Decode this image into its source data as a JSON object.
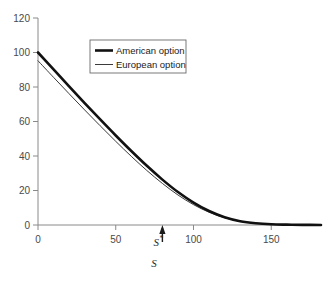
{
  "chart_data": {
    "type": "line",
    "title": "",
    "subtitle": "",
    "xlabel": "S",
    "ylabel": "",
    "xlim": [
      0,
      182
    ],
    "ylim": [
      0,
      120
    ],
    "grid": false,
    "legend_position": "top-center",
    "xticks": [
      0,
      50,
      100,
      150
    ],
    "xtick_labels": [
      "0",
      "50",
      "100",
      "150"
    ],
    "yticks": [
      0,
      20,
      40,
      60,
      80,
      100,
      120
    ],
    "ytick_labels": [
      "0",
      "20",
      "40",
      "60",
      "80",
      "100",
      "120"
    ],
    "annotations": [
      {
        "name": "critical-price-marker",
        "label": "S",
        "superscript": "*",
        "x": 80,
        "y": 0,
        "arrow": "up"
      }
    ],
    "series": [
      {
        "name": "American option",
        "color": "#111111",
        "linewidth": 2.6,
        "x": [
          0,
          10,
          20,
          30,
          40,
          50,
          60,
          70,
          80,
          90,
          100,
          110,
          120,
          130,
          140,
          150,
          160,
          170,
          182
        ],
        "y": [
          100,
          90.2,
          80.4,
          70.7,
          61.2,
          51.9,
          42.9,
          34.3,
          26.3,
          19.1,
          13.0,
          8.1,
          4.5,
          2.2,
          1.0,
          0.4,
          0.2,
          0.1,
          0.0
        ]
      },
      {
        "name": "European option",
        "color": "#3b3b3b",
        "linewidth": 1.0,
        "x": [
          0,
          10,
          20,
          30,
          40,
          50,
          60,
          70,
          80,
          90,
          100,
          110,
          120,
          130,
          140,
          150,
          160,
          170,
          182
        ],
        "y": [
          95.2,
          85.6,
          76.1,
          66.7,
          57.5,
          48.5,
          39.8,
          31.6,
          24.1,
          17.4,
          11.8,
          7.4,
          4.2,
          2.1,
          1.0,
          0.4,
          0.2,
          0.1,
          0.0
        ]
      }
    ]
  },
  "legend": {
    "items": [
      {
        "label": "American option",
        "style": "thick"
      },
      {
        "label": "European option",
        "style": "thin"
      }
    ]
  },
  "colors": {
    "axis": "#8a8a8a",
    "tick_text": "#4a4a4a",
    "american": "#111111",
    "european": "#3b3b3b",
    "legend_border": "#6b6b6b",
    "background": "#ffffff"
  }
}
